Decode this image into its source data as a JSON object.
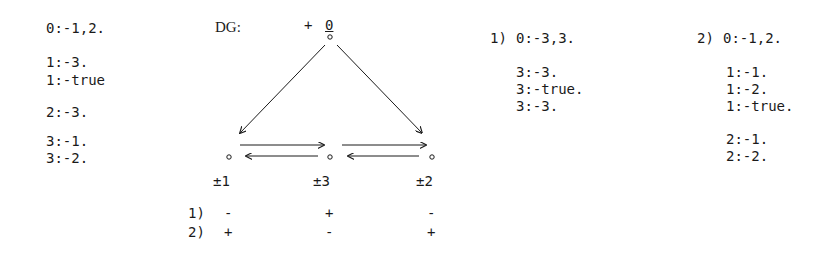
{
  "left_program": {
    "lines": [
      "0:-1,2.",
      "1:-3.",
      "1:-true",
      "2:-3.",
      "3:-1.",
      "3:-2."
    ]
  },
  "diagram": {
    "title": "DG:",
    "top_node": {
      "sign": "+",
      "label": "0"
    },
    "bottom_nodes": [
      {
        "label": "±1"
      },
      {
        "label": "±3"
      },
      {
        "label": "±2"
      }
    ],
    "edges": [
      {
        "from": "0",
        "to": "1"
      },
      {
        "from": "0",
        "to": "2"
      },
      {
        "from": "1",
        "to": "3"
      },
      {
        "from": "3",
        "to": "1"
      },
      {
        "from": "3",
        "to": "2"
      },
      {
        "from": "2",
        "to": "3"
      }
    ],
    "assignments": [
      {
        "label": "1)",
        "signs": [
          "-",
          "+",
          "-"
        ]
      },
      {
        "label": "2)",
        "signs": [
          "+",
          "-",
          "+"
        ]
      }
    ]
  },
  "program_1": {
    "label": "1)",
    "lines": [
      "0:-3,3.",
      "3:-3.",
      "3:-true.",
      "3:-3."
    ]
  },
  "program_2": {
    "label": "2)",
    "lines": [
      "0:-1,2.",
      "1:-1.",
      "1:-2.",
      "1:-true.",
      "2:-1.",
      "2:-2."
    ]
  }
}
